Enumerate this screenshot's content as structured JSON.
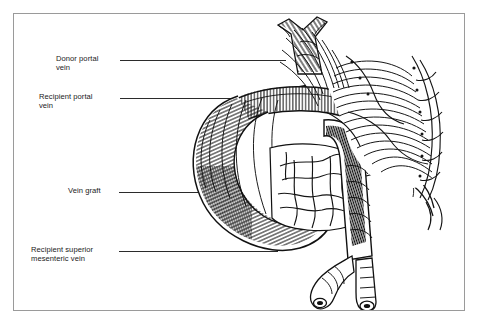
{
  "figure": {
    "kind": "anatomical-line-engraving",
    "border_color": "#9a9a9a",
    "background_color": "#ffffff",
    "ink_color": "#1a1a1a"
  },
  "labels": [
    {
      "id": "donor-portal-vein",
      "text": "Donor portal\nvein"
    },
    {
      "id": "recipient-portal-vein",
      "text": "Recipient portal\nvein"
    },
    {
      "id": "vein-graft",
      "text": "Vein graft"
    },
    {
      "id": "recipient-superior-mesenteric-vein",
      "text": "Recipient superior\nmesenteric vein"
    }
  ],
  "leaders": [
    {
      "id": "leader-donor-portal-vein"
    },
    {
      "id": "leader-recipient-portal-vein"
    },
    {
      "id": "leader-vein-graft"
    },
    {
      "id": "leader-recipient-superior-mesenteric-vein"
    }
  ],
  "illustration": {
    "title": "Vein graft interposition between donor portal vein and recipient superior mesenteric vein",
    "structures": [
      "donor-portal-vein-branching-stump",
      "anastomosis-suture-line",
      "vein-graft-loop",
      "recipient-portal-vein",
      "mesenteric-fat-and-vascular-arcade",
      "recipient-superior-mesenteric-vein",
      "smv-bifurcation-cut-ends"
    ]
  }
}
